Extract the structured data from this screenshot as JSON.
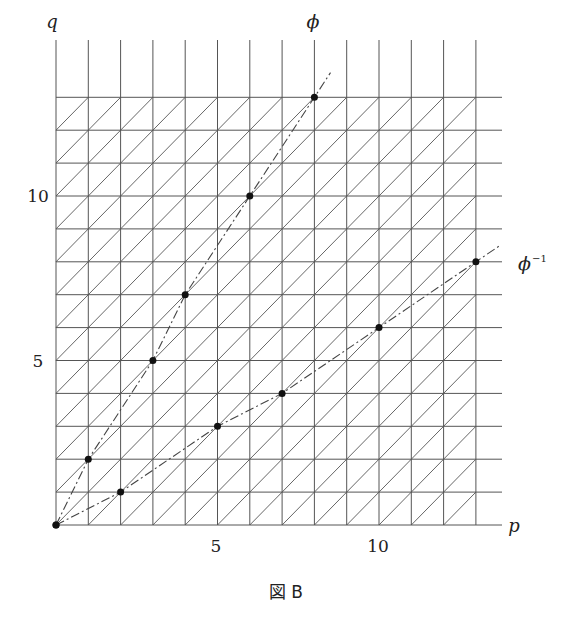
{
  "figure": {
    "caption": "図 B",
    "axis_x_label": "p",
    "axis_y_label": "q",
    "x_ticks": [
      {
        "value": 5,
        "label": "5"
      },
      {
        "value": 10,
        "label": "10"
      }
    ],
    "y_ticks": [
      {
        "value": 5,
        "label": "5"
      },
      {
        "value": 10,
        "label": "10"
      }
    ],
    "curve_labels": {
      "phi": "ϕ",
      "phi_inv_base": "ϕ",
      "phi_inv_sup": "−1"
    },
    "colors": {
      "grid": "#555555",
      "curve": "#444444",
      "point": "#111111"
    }
  },
  "chart_data": {
    "type": "scatter",
    "title": "図 B",
    "xlabel": "p",
    "ylabel": "q",
    "xlim": [
      0,
      13
    ],
    "ylim": [
      0,
      13
    ],
    "grid": "triangular lattice (unit squares with diagonal)",
    "series": [
      {
        "name": "ϕ",
        "points": [
          [
            0,
            0
          ],
          [
            1,
            2
          ],
          [
            3,
            5
          ],
          [
            4,
            7
          ],
          [
            6,
            10
          ],
          [
            8,
            13
          ]
        ],
        "style": "dash-dot"
      },
      {
        "name": "ϕ^-1",
        "points": [
          [
            0,
            0
          ],
          [
            2,
            1
          ],
          [
            5,
            3
          ],
          [
            7,
            4
          ],
          [
            10,
            6
          ],
          [
            13,
            8
          ]
        ],
        "style": "dash-dot"
      }
    ]
  }
}
